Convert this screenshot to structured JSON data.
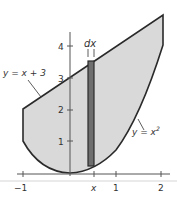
{
  "figure": {
    "curves": {
      "line_label": "y = x + 3",
      "parabola_label": "y = x",
      "parabola_exponent": "2"
    },
    "strip_label": "dx",
    "x_ticks": [
      {
        "value": -1,
        "label": "−1"
      },
      {
        "value": "x",
        "label": "x"
      },
      {
        "value": 1,
        "label": "1"
      },
      {
        "value": 2,
        "label": "2"
      }
    ],
    "y_ticks": [
      {
        "value": 1,
        "label": "1"
      },
      {
        "value": 2,
        "label": "2"
      },
      {
        "value": 3,
        "label": "3"
      },
      {
        "value": 4,
        "label": "4"
      }
    ],
    "colors": {
      "region_fill": "#d9d9d9",
      "strip_fill": "#6e6e6e",
      "outline": "#2a2a2a",
      "axis": "#555555"
    }
  }
}
